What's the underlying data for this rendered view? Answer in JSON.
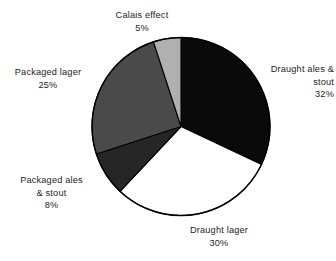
{
  "chart_data": {
    "type": "pie",
    "title": "",
    "subtitle": "",
    "xlabel": "",
    "ylabel": "",
    "grid": false,
    "legend_position": "none",
    "label_format": "name-and-percent",
    "start_angle_deg": 0,
    "direction": "clockwise",
    "categories": [
      "Draught ales & stout",
      "Draught lager",
      "Packaged ales & stout",
      "Packaged lager",
      "Calais effect"
    ],
    "values": [
      32,
      30,
      8,
      25,
      5
    ],
    "units": "%",
    "total": 100,
    "colors": [
      "#0a0a0a",
      "#ffffff",
      "#262626",
      "#4a4a4a",
      "#b0b0b0"
    ],
    "slices": [
      {
        "name": "Draught ales & stout",
        "value": 32,
        "value_label": "32%",
        "color": "#0a0a0a",
        "start_deg": 0,
        "end_deg": 115.2
      },
      {
        "name": "Draught lager",
        "value": 30,
        "value_label": "30%",
        "color": "#ffffff",
        "start_deg": 115.2,
        "end_deg": 223.2
      },
      {
        "name": "Packaged ales & stout",
        "value": 8,
        "value_label": "8%",
        "color": "#262626",
        "start_deg": 223.2,
        "end_deg": 252.0
      },
      {
        "name": "Packaged lager",
        "value": 25,
        "value_label": "25%",
        "color": "#4a4a4a",
        "start_deg": 252.0,
        "end_deg": 342.0
      },
      {
        "name": "Calais effect",
        "value": 5,
        "value_label": "5%",
        "color": "#b0b0b0",
        "start_deg": 342.0,
        "end_deg": 360.0
      }
    ]
  },
  "labels": {
    "calais": {
      "line1": "Calais effect",
      "line2": "5%"
    },
    "draught_ales": {
      "line1": "Draught ales &",
      "line2": "stout",
      "line3": "32%"
    },
    "packaged_lager": {
      "line1": "Packaged lager",
      "line2": "25%"
    },
    "packaged_ales": {
      "line1": "Packaged ales",
      "line2": "& stout",
      "line3": "8%"
    },
    "draught_lager": {
      "line1": "Draught lager",
      "line2": "30%"
    }
  },
  "style": {
    "background": "#ffffff",
    "outline_color": "#000000",
    "text_color": "#1c1c1c"
  }
}
